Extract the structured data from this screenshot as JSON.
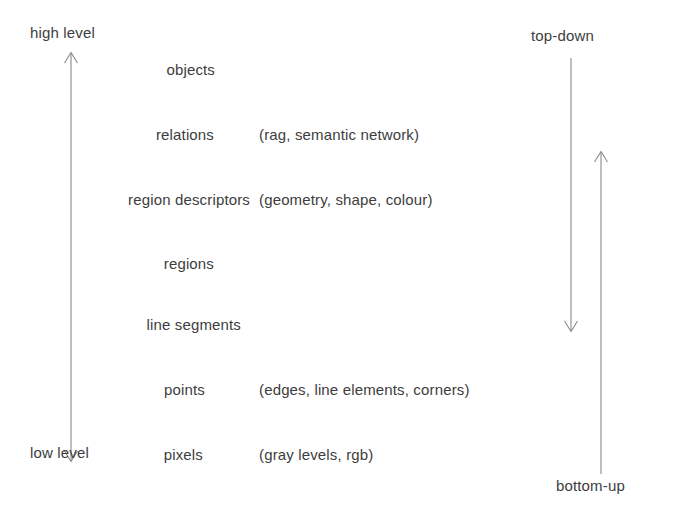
{
  "diagram": {
    "stroke_color": "#8a8a8a",
    "text_color": "#3d3d3d",
    "background_color": "#ffffff",
    "left_axis": {
      "top_label": "high level",
      "bottom_label": "low level",
      "arrow_style": "double-headed",
      "direction": "vertical"
    },
    "right_axes": [
      {
        "label": "top-down",
        "label_position": "top",
        "arrow_style": "single-headed",
        "direction": "downward"
      },
      {
        "label": "bottom-up",
        "label_position": "bottom",
        "arrow_style": "single-headed",
        "direction": "upward"
      }
    ],
    "levels": [
      {
        "name": "objects",
        "detail": ""
      },
      {
        "name": "relations",
        "detail": "(rag, semantic network)"
      },
      {
        "name": "region descriptors",
        "detail": "(geometry, shape, colour)"
      },
      {
        "name": "regions",
        "detail": ""
      },
      {
        "name": "line segments",
        "detail": ""
      },
      {
        "name": "points",
        "detail": "(edges, line elements, corners)"
      },
      {
        "name": "pixels",
        "detail": "(gray levels, rgb)"
      }
    ]
  }
}
